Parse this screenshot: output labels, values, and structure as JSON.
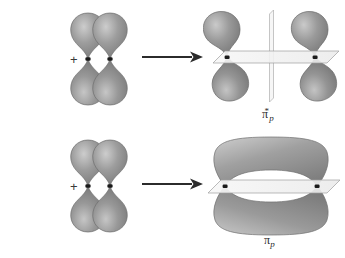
{
  "figure": {
    "background_color": "#ffffff"
  },
  "palette": {
    "lobe_fill_dark": "#7f7f7f",
    "lobe_fill_mid": "#9a9a9a",
    "lobe_fill_light": "#c9c9c9",
    "lobe_outline": "#6e6e6e",
    "nucleus_color": "#1a1a1a",
    "plane_fill": "#f2f2f2",
    "plane_outline": "#9e9e9e",
    "arrow_color": "#2b2b2b",
    "label_color": "#2b2b2b",
    "plus_color": "#3a3a3a"
  },
  "rows": [
    {
      "id": "antibonding",
      "name": "antibonding-row",
      "operator": "+",
      "arrow": "⟶",
      "reactants": [
        {
          "name": "p-orbital-left",
          "label": "p orbital"
        },
        {
          "name": "p-orbital-right",
          "label": "p orbital"
        }
      ],
      "product": {
        "name": "pi-star-antibonding-orbital",
        "lobe_count": 4,
        "nodal_planes": 2,
        "nodal_plane_orientations": [
          "horizontal",
          "vertical"
        ],
        "label": {
          "symbol": "π",
          "subscript": "p",
          "superscript": "*",
          "full": "π*p"
        }
      }
    },
    {
      "id": "bonding",
      "name": "bonding-row",
      "operator": "+",
      "arrow": "⟶",
      "reactants": [
        {
          "name": "p-orbital-left",
          "label": "p orbital"
        },
        {
          "name": "p-orbital-right",
          "label": "p orbital"
        }
      ],
      "product": {
        "name": "pi-bonding-orbital",
        "lobe_count": 2,
        "nodal_planes": 1,
        "nodal_plane_orientations": [
          "horizontal"
        ],
        "label": {
          "symbol": "π",
          "subscript": "p",
          "superscript": "",
          "full": "πp"
        }
      }
    }
  ]
}
